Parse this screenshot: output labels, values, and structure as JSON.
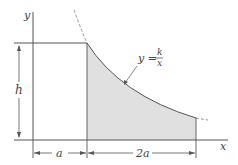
{
  "diagram": {
    "axes": {
      "x_label": "x",
      "y_label": "y"
    },
    "curve": {
      "equation_lhs": "y =",
      "numerator": "k",
      "denominator": "x"
    },
    "dimensions": {
      "height_label": "h",
      "width_left_label": "a",
      "width_right_label": "2a"
    },
    "colors": {
      "line": "#555555",
      "shade": "#e0e0e0",
      "dashed": "#888888"
    }
  }
}
